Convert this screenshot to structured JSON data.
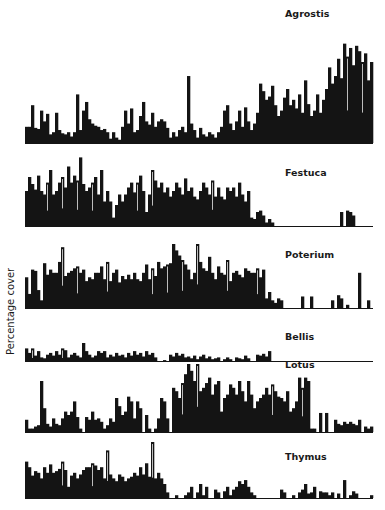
{
  "chart_data": {
    "type": "bar",
    "layout": "stacked-panels",
    "ylabel": "Percentage cover",
    "xlabel": "",
    "x_description": "position along transect (116 contiguous intervals, unlabeled)",
    "value_scale": "relative cover, 0-1 of each panel's maximum height (no axis ticks shown)",
    "grid": false,
    "panels": [
      {
        "name": "Agrostis",
        "label_position": "top-right",
        "values": [
          0.15,
          0.15,
          0.35,
          0.14,
          0.13,
          0.3,
          0.2,
          0.27,
          0.08,
          0.1,
          0.28,
          0.12,
          0.09,
          0.08,
          0.1,
          0.06,
          0.1,
          0.45,
          0.12,
          0.3,
          0.38,
          0.22,
          0.18,
          0.16,
          0.15,
          0.12,
          0.13,
          0.1,
          0.04,
          0.1,
          0.05,
          0.03,
          0.15,
          0.3,
          0.18,
          0.32,
          0.1,
          0.12,
          0.25,
          0.38,
          0.2,
          0.17,
          0.28,
          0.15,
          0.2,
          0.22,
          0.2,
          0.14,
          0.05,
          0.1,
          0.06,
          0.12,
          0.15,
          0.1,
          0.62,
          0.18,
          0.12,
          0.05,
          0.14,
          0.08,
          0.06,
          0.1,
          0.08,
          0.05,
          0.1,
          0.15,
          0.3,
          0.35,
          0.18,
          0.12,
          0.2,
          0.3,
          0.15,
          0.33,
          0.2,
          0.12,
          0.18,
          0.28,
          0.55,
          0.48,
          0.4,
          0.43,
          0.53,
          0.35,
          0.25,
          0.3,
          0.42,
          0.5,
          0.35,
          0.4,
          0.32,
          0.45,
          0.28,
          0.58,
          0.36,
          0.25,
          0.3,
          0.45,
          0.28,
          0.4,
          0.5,
          0.7,
          0.55,
          0.62,
          0.78,
          0.6,
          0.92,
          0.8,
          0.88,
          0.72,
          0.9,
          0.85,
          0.75,
          0.83,
          0.58,
          0.75
        ]
      },
      {
        "name": "Festuca",
        "label_position": "top-right",
        "values": [
          0.5,
          0.7,
          0.6,
          0.52,
          0.72,
          0.5,
          0.45,
          0.62,
          0.8,
          0.45,
          0.5,
          0.62,
          0.7,
          0.55,
          0.85,
          0.62,
          0.72,
          0.65,
          0.98,
          0.6,
          0.5,
          0.55,
          0.62,
          0.7,
          0.45,
          0.8,
          0.35,
          0.5,
          0.35,
          0.12,
          0.3,
          0.45,
          0.35,
          0.45,
          0.55,
          0.62,
          0.48,
          0.62,
          0.72,
          0.5,
          0.2,
          0.45,
          0.8,
          0.65,
          0.55,
          0.62,
          0.48,
          0.55,
          0.42,
          0.5,
          0.62,
          0.55,
          0.45,
          0.68,
          0.5,
          0.55,
          0.42,
          0.38,
          0.5,
          0.62,
          0.55,
          0.45,
          0.65,
          0.42,
          0.55,
          0.42,
          0.38,
          0.55,
          0.5,
          0.55,
          0.42,
          0.62,
          0.45,
          0.35,
          0.5,
          0.12,
          0.1,
          0.2,
          0.22,
          0.15,
          0.05,
          0.1,
          0.05,
          0.0,
          0.0,
          0.0,
          0.0,
          0.0,
          0.0,
          0.0,
          0.0,
          0.0,
          0.0,
          0.0,
          0.0,
          0.0,
          0.0,
          0.0,
          0.0,
          0.0,
          0.0,
          0.0,
          0.0,
          0.0,
          0.0,
          0.2,
          0.0,
          0.22,
          0.2,
          0.15,
          0.0,
          0.0,
          0.0,
          0.0,
          0.0,
          0.0
        ]
      },
      {
        "name": "Poterium",
        "label_position": "top-right",
        "values": [
          0.48,
          0.22,
          0.6,
          0.58,
          0.28,
          0.12,
          0.7,
          0.52,
          0.6,
          0.55,
          0.55,
          0.72,
          0.95,
          0.5,
          0.55,
          0.58,
          0.62,
          0.65,
          0.55,
          0.6,
          0.42,
          0.48,
          0.45,
          0.55,
          0.55,
          0.65,
          0.45,
          0.72,
          0.42,
          0.55,
          0.6,
          0.4,
          0.5,
          0.45,
          0.52,
          0.45,
          0.55,
          0.45,
          0.42,
          0.55,
          0.68,
          0.45,
          0.62,
          0.5,
          0.72,
          0.62,
          0.65,
          0.68,
          0.7,
          1.0,
          0.9,
          0.82,
          0.75,
          0.68,
          0.6,
          0.45,
          0.55,
          1.0,
          0.72,
          0.62,
          0.58,
          0.8,
          0.55,
          0.45,
          0.65,
          0.55,
          0.52,
          0.75,
          0.42,
          0.55,
          0.58,
          0.52,
          0.48,
          0.62,
          0.58,
          0.55,
          0.55,
          0.62,
          0.48,
          0.6,
          0.15,
          0.25,
          0.12,
          0.08,
          0.15,
          0.12,
          0.0,
          0.0,
          0.0,
          0.0,
          0.0,
          0.0,
          0.18,
          0.0,
          0.0,
          0.18,
          0.0,
          0.0,
          0.0,
          0.0,
          0.0,
          0.0,
          0.12,
          0.0,
          0.2,
          0.15,
          0.0,
          0.05,
          0.0,
          0.0,
          0.0,
          0.55,
          0.0,
          0.0,
          0.12,
          0.0
        ]
      },
      {
        "name": "Bellis",
        "label_position": "top-right",
        "values": [
          0.7,
          0.45,
          0.7,
          0.3,
          0.55,
          0.2,
          0.15,
          0.35,
          0.45,
          0.3,
          0.55,
          0.35,
          0.7,
          0.6,
          0.2,
          0.35,
          0.45,
          0.3,
          0.2,
          1.0,
          0.55,
          0.35,
          0.2,
          0.3,
          0.55,
          0.45,
          0.55,
          0.2,
          0.35,
          0.25,
          0.45,
          0.3,
          0.35,
          0.2,
          0.45,
          0.3,
          0.55,
          0.35,
          0.45,
          0.25,
          0.55,
          0.35,
          0.45,
          0.2,
          0.0,
          0.0,
          0.05,
          0.0,
          0.35,
          0.25,
          0.45,
          0.3,
          0.4,
          0.2,
          0.25,
          0.15,
          0.3,
          0.1,
          0.25,
          0.35,
          0.15,
          0.25,
          0.1,
          0.15,
          0.2,
          0.0,
          0.1,
          0.2,
          0.1,
          0.0,
          0.2,
          0.15,
          0.1,
          0.3,
          0.15,
          0.0,
          0.0,
          0.35,
          0.3,
          0.4,
          0.25,
          0.55,
          0.0,
          0.0,
          0.0,
          0.0,
          0.0,
          0.0,
          0.0,
          0.0,
          0.0,
          0.0,
          0.0,
          0.0,
          0.0,
          0.0,
          0.0,
          0.0,
          0.0,
          0.0,
          0.0,
          0.0,
          0.0,
          0.0,
          0.0,
          0.0,
          0.0,
          0.0,
          0.0,
          0.0,
          0.0,
          0.0,
          0.0,
          0.0,
          0.0,
          0.0
        ]
      },
      {
        "name": "Lotus",
        "label_position": "top-right",
        "values": [
          0.18,
          0.05,
          0.05,
          0.08,
          0.1,
          0.75,
          0.35,
          0.12,
          0.08,
          0.2,
          0.12,
          0.1,
          0.2,
          0.3,
          0.25,
          0.3,
          0.45,
          0.22,
          0.05,
          0.0,
          0.22,
          0.18,
          0.3,
          0.18,
          0.2,
          0.15,
          0.05,
          0.1,
          0.2,
          0.15,
          0.5,
          0.38,
          0.25,
          0.3,
          0.52,
          0.45,
          0.2,
          0.45,
          0.35,
          0.0,
          0.25,
          0.05,
          0.0,
          0.05,
          0.2,
          0.5,
          0.45,
          0.2,
          0.0,
          0.65,
          0.6,
          0.5,
          0.72,
          0.85,
          1.0,
          0.9,
          0.75,
          1.0,
          0.6,
          0.65,
          0.72,
          0.8,
          0.55,
          0.7,
          0.75,
          0.3,
          0.5,
          0.55,
          0.7,
          0.65,
          0.55,
          0.75,
          0.6,
          0.45,
          0.75,
          0.55,
          0.35,
          0.45,
          0.5,
          0.55,
          0.65,
          0.55,
          0.7,
          0.6,
          0.52,
          0.5,
          0.45,
          0.6,
          0.3,
          0.35,
          0.45,
          0.8,
          0.65,
          0.8,
          0.75,
          0.05,
          0.05,
          0.0,
          0.28,
          0.0,
          0.28,
          0.0,
          0.0,
          0.18,
          0.12,
          0.1,
          0.15,
          0.12,
          0.15,
          0.12,
          0.1,
          0.18,
          0.0,
          0.08,
          0.05,
          0.08
        ]
      },
      {
        "name": "Thymus",
        "label_position": "top-right",
        "values": [
          0.65,
          0.55,
          0.4,
          0.48,
          0.45,
          0.35,
          0.55,
          0.45,
          0.6,
          0.45,
          0.48,
          0.52,
          0.65,
          0.5,
          0.2,
          0.4,
          0.45,
          0.35,
          0.42,
          0.5,
          0.55,
          0.55,
          0.62,
          0.58,
          0.5,
          0.55,
          0.35,
          0.85,
          0.42,
          0.35,
          0.3,
          0.42,
          0.38,
          0.3,
          0.35,
          0.38,
          0.45,
          0.4,
          0.55,
          0.42,
          0.62,
          0.38,
          1.0,
          0.35,
          0.45,
          0.35,
          0.25,
          0.1,
          0.0,
          0.0,
          0.05,
          0.0,
          0.0,
          0.05,
          0.1,
          0.2,
          0.0,
          0.1,
          0.25,
          0.05,
          0.2,
          0.0,
          0.0,
          0.15,
          0.1,
          0.0,
          0.12,
          0.2,
          0.05,
          0.15,
          0.2,
          0.3,
          0.25,
          0.32,
          0.2,
          0.1,
          0.05,
          0.0,
          0.0,
          0.0,
          0.0,
          0.0,
          0.0,
          0.0,
          0.0,
          0.15,
          0.1,
          0.0,
          0.0,
          0.05,
          0.0,
          0.1,
          0.15,
          0.25,
          0.08,
          0.1,
          0.2,
          0.0,
          0.12,
          0.1,
          0.1,
          0.05,
          0.1,
          0.0,
          0.08,
          0.0,
          0.32,
          0.0,
          0.05,
          0.12,
          0.08,
          0.0,
          0.0,
          0.0,
          0.0,
          0.05
        ]
      }
    ]
  }
}
